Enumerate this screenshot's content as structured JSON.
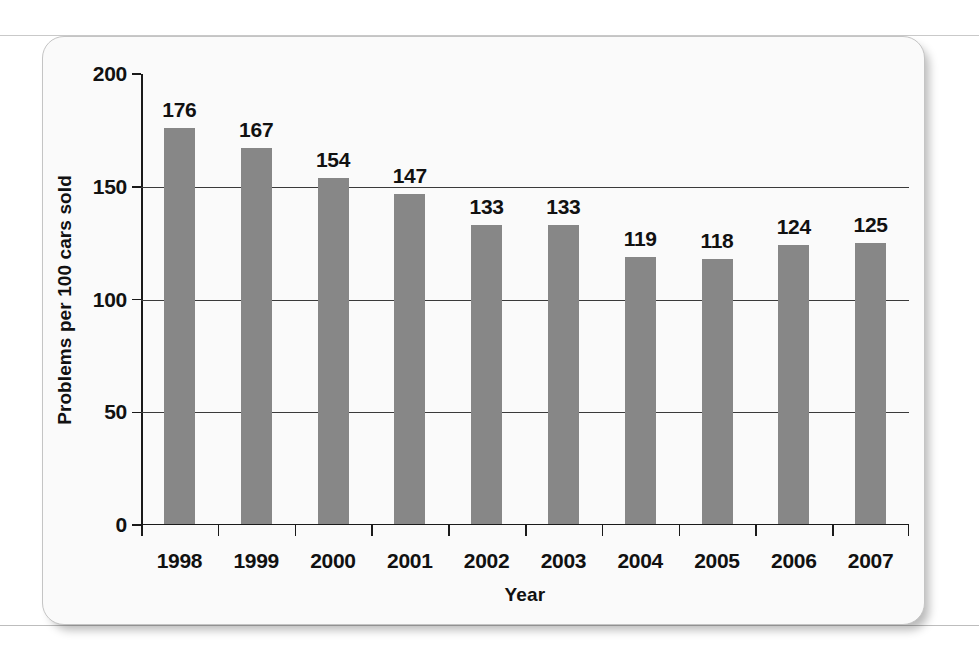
{
  "chart_data": {
    "type": "bar",
    "title": "",
    "xlabel": "Year",
    "ylabel": "Problems per 100 cars sold",
    "categories": [
      "1998",
      "1999",
      "2000",
      "2001",
      "2002",
      "2003",
      "2004",
      "2005",
      "2006",
      "2007"
    ],
    "values": [
      176,
      167,
      154,
      147,
      133,
      133,
      119,
      118,
      124,
      125
    ],
    "value_labels": [
      "176",
      "167",
      "154",
      "147",
      "133",
      "133",
      "119",
      "118",
      "124",
      "125"
    ],
    "ylim": [
      0,
      200
    ],
    "xlim_categories": 10,
    "yticks": [
      0,
      50,
      100,
      150,
      200
    ],
    "ytick_labels": [
      "0",
      "50",
      "100",
      "150",
      "200"
    ],
    "grid": "horizontal",
    "gridlines_at": [
      50,
      100,
      150
    ],
    "legend": "none",
    "bar_color": "#878787",
    "axis_color": "#1a1a1a",
    "label_color": "#111111",
    "plot_background": "#fafafa",
    "data_labels_shown": true
  }
}
